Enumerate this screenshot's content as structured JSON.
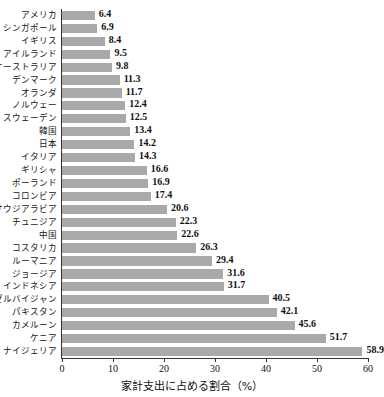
{
  "top_fragment": "——— —— — ——— — —— ——— — ————",
  "chart_data": {
    "type": "bar",
    "orientation": "horizontal",
    "title": "",
    "xlabel": "家計支出に占める割合（%）",
    "ylabel": "",
    "xlim": [
      0,
      60
    ],
    "xticks": [
      0,
      10,
      20,
      30,
      40,
      50,
      60
    ],
    "xticklabels": [
      "0",
      "10",
      "20",
      "30",
      "40",
      "50",
      "60"
    ],
    "grid": false,
    "legend": null,
    "bar_color": "#a9a9a9",
    "axis_color": "#333333",
    "background": "#ffffff",
    "value_labels": true,
    "categories": [
      "アメリカ",
      "シンガポール",
      "イギリス",
      "アイルランド",
      "オーストラリア",
      "デンマーク",
      "オランダ",
      "ノルウェー",
      "スウェーデン",
      "韓国",
      "日本",
      "イタリア",
      "ギリシャ",
      "ポーランド",
      "コロンビア",
      "サウジアラビア",
      "チュニジア",
      "中国",
      "コスタリカ",
      "ルーマニア",
      "ジョージア",
      "インドネシア",
      "アゼルバイジャン",
      "パキスタン",
      "カメルーン",
      "ケニア",
      "ナイジェリア"
    ],
    "values": [
      6.4,
      6.9,
      8.4,
      9.5,
      9.8,
      11.3,
      11.7,
      12.4,
      12.5,
      13.4,
      14.2,
      14.3,
      16.6,
      16.9,
      17.4,
      20.6,
      22.3,
      22.6,
      26.3,
      29.4,
      31.6,
      31.7,
      40.5,
      42.1,
      45.6,
      51.7,
      58.9
    ],
    "value_label_texts": [
      "6.4",
      "6.9",
      "8.4",
      "9.5",
      "9.8",
      "11.3",
      "11.7",
      "12.4",
      "12.5",
      "13.4",
      "14.2",
      "14.3",
      "16.6",
      "16.9",
      "17.4",
      "20.6",
      "22.3",
      "22.6",
      "26.3",
      "29.4",
      "31.6",
      "31.7",
      "40.5",
      "42.1",
      "45.6",
      "51.7",
      "58.9"
    ]
  }
}
